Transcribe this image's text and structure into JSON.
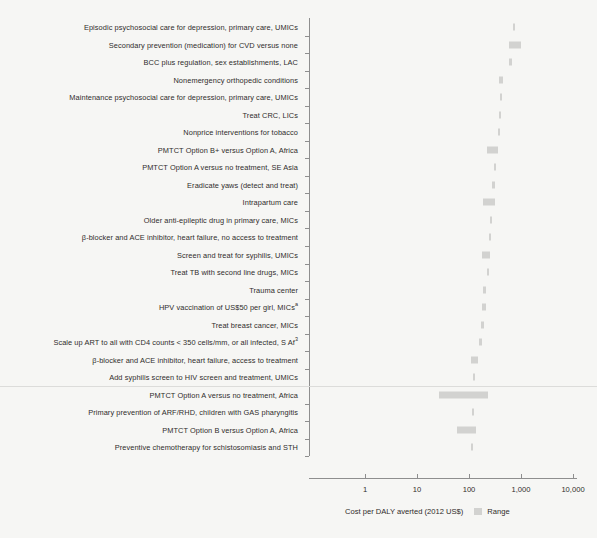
{
  "chart_data": {
    "type": "bar",
    "orientation": "horizontal",
    "title": "",
    "subtitle": "",
    "xlabel": "Cost per DALY averted (2012 US$)",
    "ylabel": "",
    "xscale": "log",
    "xlim": [
      1,
      10000
    ],
    "xticks": [
      1,
      10,
      100,
      1000,
      10000
    ],
    "xticklabels": [
      "1",
      "10",
      "100",
      "1,000",
      "10,000"
    ],
    "grid": false,
    "legend": {
      "position": "bottom-right",
      "entries": [
        {
          "label": "Range",
          "color": "#d2d2d0",
          "swatch": "square"
        }
      ]
    },
    "bar_color": "#d2d2d0",
    "categories": [
      "Episodic psychosocial care for depression, primary care, UMICs",
      "Secondary prevention (medication) for CVD versus none",
      "BCC plus regulation, sex establishments, LAC",
      "Nonemergency orthopedic conditions",
      "Maintenance psychosocial care for depression, primary care, UMICs",
      "Treat CRC, LICs",
      "Nonprice interventions for tobacco",
      "PMTCT Option B+ versus Option A, Africa",
      "PMTCT Option A versus no treatment, SE Asia",
      "Eradicate yaws (detect and treat)",
      "Intrapartum care",
      "Older anti-epileptic drug in primary care, MICs",
      "β-blocker and ACE inhibitor, heart failure, no access to treatment",
      "Screen and treat for syphilis, UMICs",
      "Treat TB with second line drugs, MICs",
      "Trauma center",
      "HPV vaccination of US$50 per girl, MICs",
      "Treat breast cancer, MICs",
      "Scale up ART to all with CD4 counts < 350 cells/mm, or all infected, S Af",
      "β-blocker and ACE inhibitor, heart failure, access to treatment",
      "Add syphilis screen to HIV screen and treatment, UMICs",
      "PMTCT Option A versus no treatment, Africa",
      "Primary prevention of ARF/RHD, children with GAS pharyngitis",
      "PMTCT Option B versus Option A, Africa",
      "Preventive chemotherapy for schistosomiasis and STH"
    ],
    "category_superscripts": [
      "",
      "",
      "",
      "",
      "",
      "",
      "",
      "",
      "",
      "",
      "",
      "",
      "",
      "",
      "",
      "",
      "a",
      "",
      "3",
      "",
      "",
      "",
      "",
      "",
      ""
    ],
    "ranges": [
      {
        "category": "Episodic psychosocial care for depression, primary care, UMICs",
        "low": 690,
        "high": 760
      },
      {
        "category": "Secondary prevention (medication) for CVD versus none",
        "low": 580,
        "high": 1000
      },
      {
        "category": "BCC plus regulation, sex establishments, LAC",
        "low": 600,
        "high": 660
      },
      {
        "category": "Nonemergency orthopedic conditions",
        "low": 370,
        "high": 460
      },
      {
        "category": "Maintenance psychosocial care for depression, primary care, UMICs",
        "low": 400,
        "high": 440
      },
      {
        "category": "Treat CRC, LICs",
        "low": 370,
        "high": 410
      },
      {
        "category": "Nonprice interventions for tobacco",
        "low": 365,
        "high": 400
      },
      {
        "category": "PMTCT Option B+ versus Option A, Africa",
        "low": 225,
        "high": 360
      },
      {
        "category": "PMTCT Option A versus no treatment, SE Asia",
        "low": 300,
        "high": 330
      },
      {
        "category": "Eradicate yaws (detect and treat)",
        "low": 280,
        "high": 310
      },
      {
        "category": "Intrapartum care",
        "low": 190,
        "high": 310
      },
      {
        "category": "Older anti-epileptic drug in primary care, MICs",
        "low": 250,
        "high": 275
      },
      {
        "category": "β-blocker and ACE inhibitor, heart failure, no access to treatment",
        "low": 245,
        "high": 265
      },
      {
        "category": "Screen and treat for syphilis, UMICs",
        "low": 180,
        "high": 255
      },
      {
        "category": "Treat TB with second line drugs, MICs",
        "low": 225,
        "high": 245
      },
      {
        "category": "Trauma center",
        "low": 190,
        "high": 215
      },
      {
        "category": "HPV vaccination of US$50 per girl, MICs",
        "low": 175,
        "high": 210
      },
      {
        "category": "Treat breast cancer, MICs",
        "low": 170,
        "high": 195
      },
      {
        "category": "Scale up ART to all with CD4 counts < 350 cells/mm3, or all infected, S Af",
        "low": 155,
        "high": 175
      },
      {
        "category": "β-blocker and ACE inhibitor, heart failure, access to treatment",
        "low": 108,
        "high": 150
      },
      {
        "category": "Add syphilis screen to HIV screen and treatment, UMICs",
        "low": 120,
        "high": 130
      },
      {
        "category": "PMTCT Option A versus no treatment, Africa",
        "low": 26,
        "high": 235
      },
      {
        "category": "Primary prevention of ARF/RHD, children with GAS pharyngitis",
        "low": 112,
        "high": 122
      },
      {
        "category": "PMTCT Option B versus Option A, Africa",
        "low": 58,
        "high": 135
      },
      {
        "category": "Preventive chemotherapy for schistosomiasis and STH",
        "low": 108,
        "high": 118
      }
    ]
  },
  "legend": {
    "axis_title": "Cost per DALY averted (2012 US$)",
    "range_label": "Range"
  }
}
